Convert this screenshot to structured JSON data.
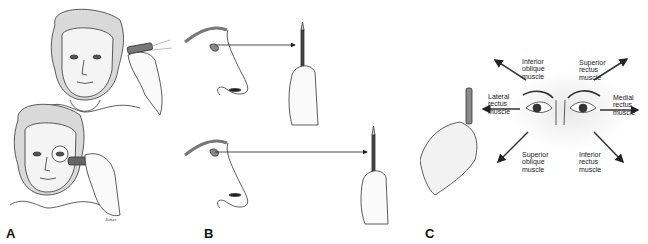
{
  "figure": {
    "panels": [
      {
        "id": "A",
        "label": "A",
        "description": "Patient face with penlight shone toward eye; patient with occluder covering one eye",
        "signature": "Jones"
      },
      {
        "id": "B",
        "label": "B",
        "description": "Profile views of eye fixating on a pencil held near, then far"
      },
      {
        "id": "C",
        "label": "C",
        "description": "Eyes following pen in six cardinal gaze directions"
      }
    ],
    "muscles": {
      "upper_left": [
        "Inferior",
        "oblique",
        "muscle"
      ],
      "upper_right": [
        "Superior",
        "rectus",
        "muscle"
      ],
      "left": [
        "Lateral",
        "rectus",
        "muscle"
      ],
      "right": [
        "Medial",
        "rectus",
        "muscle"
      ],
      "lower_left": [
        "Superior",
        "oblique",
        "muscle"
      ],
      "lower_right": [
        "Inferior",
        "rectus",
        "muscle"
      ]
    }
  }
}
